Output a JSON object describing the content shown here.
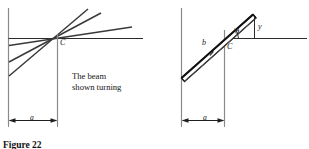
{
  "figure": {
    "caption": "Figure 22",
    "caption_visible_fragment": "Figure 22",
    "panels": [
      {
        "id": "left-panel",
        "name": "beam-turning-panel",
        "note_line1": "The beam",
        "note_line2": "shown turning",
        "labels": {
          "point_c": "C",
          "dimension_a": "a"
        },
        "elements": {
          "wall_label": "vertical wall",
          "beam_count": 3,
          "reference_line": "horizontal reference line"
        }
      },
      {
        "id": "right-panel",
        "name": "beam-geometry-panel",
        "labels": {
          "point_c": "C",
          "dimension_a": "a",
          "beam_length_b": "b",
          "rise_y": "y",
          "angle_theta": "θ"
        },
        "elements": {
          "wall_label": "vertical wall",
          "beam_count": 1,
          "reference_line": "horizontal reference line"
        }
      }
    ],
    "colors": {
      "line": "#2b2b2b",
      "beam_fill": "#ffffff",
      "beam_stroke": "#1a1a1a",
      "text": "#141414",
      "background": "#ffffff"
    }
  }
}
